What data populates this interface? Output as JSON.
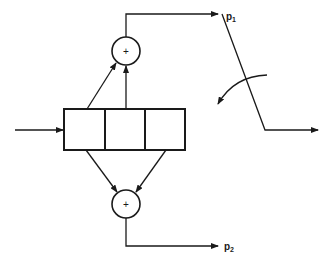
{
  "diagram": {
    "type": "convolutional-encoder",
    "shift_register": {
      "cells": 3
    },
    "adders": [
      {
        "id": "top",
        "symbol": "+",
        "output_label": "p",
        "output_subscript": "1"
      },
      {
        "id": "bottom",
        "symbol": "+",
        "output_label": "p",
        "output_subscript": "2"
      }
    ],
    "switch": {
      "description": "commutator switch selecting between p1 and p2"
    },
    "colors": {
      "stroke": "#1a1a1a",
      "background": "#ffffff"
    }
  }
}
